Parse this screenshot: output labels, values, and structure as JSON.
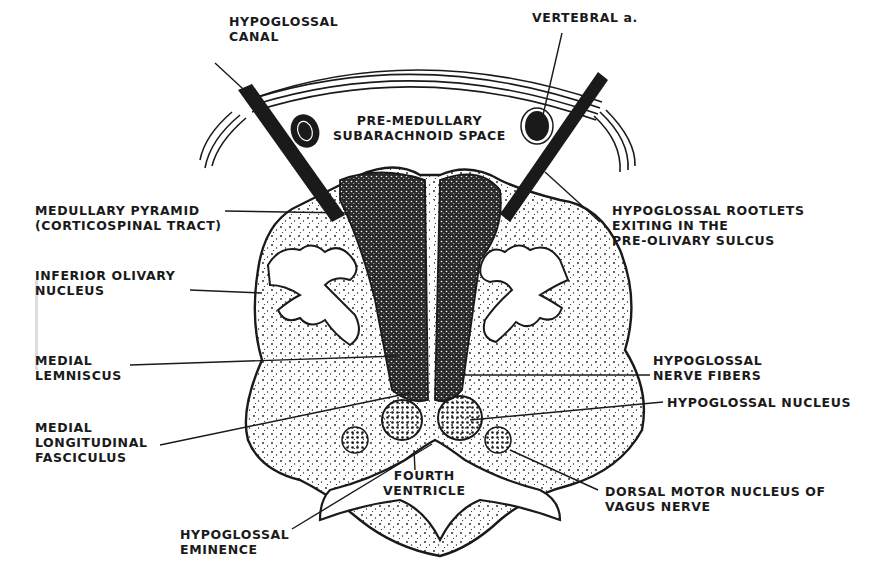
{
  "figure": {
    "style": "black-and-white stippled line drawing",
    "colors": {
      "ink": "#1a1a1a",
      "background": "#ffffff"
    }
  },
  "labels": {
    "hypoglossal_canal": [
      "HYPOGLOSSAL",
      "CANAL"
    ],
    "vertebral_artery": [
      "VERTEBRAL a."
    ],
    "premedullary_space": [
      "PRE-MEDULLARY",
      "SUBARACHNOID SPACE"
    ],
    "medullary_pyramid": [
      "MEDULLARY PYRAMID",
      "(CORTICOSPINAL TRACT)"
    ],
    "inferior_olivary_nucleus": [
      "INFERIOR OLIVARY",
      "NUCLEUS"
    ],
    "medial_lemniscus": [
      "MEDIAL",
      "LEMNISCUS"
    ],
    "medial_longitudinal_fasciculus": [
      "MEDIAL",
      "LONGITUDINAL",
      "FASCICULUS"
    ],
    "hypoglossal_eminence": [
      "HYPOGLOSSAL",
      "EMINENCE"
    ],
    "fourth_ventricle": [
      "FOURTH",
      "VENTRICLE"
    ],
    "hypoglossal_rootlets": [
      "HYPOGLOSSAL ROOTLETS",
      "EXITING IN THE",
      "PRE-OLIVARY SULCUS"
    ],
    "hypoglossal_nerve_fibers": [
      "HYPOGLOSSAL",
      "NERVE FIBERS"
    ],
    "hypoglossal_nucleus": [
      "HYPOGLOSSAL NUCLEUS"
    ],
    "dorsal_motor_nucleus": [
      "DORSAL MOTOR NUCLEUS OF",
      "VAGUS NERVE"
    ]
  }
}
